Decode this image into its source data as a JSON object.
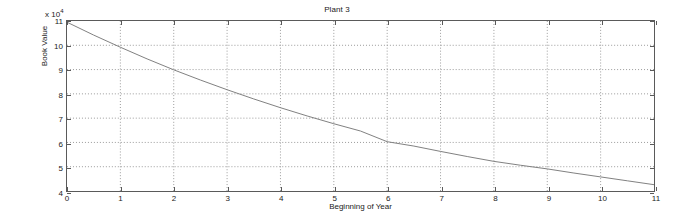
{
  "chart_data": {
    "type": "line",
    "title": "Plant 3",
    "xlabel": "Beginning of Year",
    "ylabel": "Book Value",
    "y_exponent_label": "x 10",
    "y_exponent_power": "4",
    "y_scale_factor": 10000,
    "xlim": [
      0,
      11
    ],
    "ylim": [
      4,
      11
    ],
    "xticks": [
      0,
      1,
      2,
      3,
      4,
      5,
      6,
      7,
      8,
      9,
      10,
      11
    ],
    "yticks": [
      4,
      5,
      6,
      7,
      8,
      9,
      10,
      11
    ],
    "xtick_labels": [
      "0",
      "1",
      "2",
      "3",
      "4",
      "5",
      "6",
      "7",
      "8",
      "9",
      "10",
      "11"
    ],
    "ytick_labels": [
      "4",
      "5",
      "6",
      "7",
      "8",
      "9",
      "10",
      "11"
    ],
    "grid": true,
    "grid_style": "dotted",
    "legend": false,
    "line_color": "#808080",
    "axis_color": "#5a5a5a",
    "background_color": "#ffffff",
    "series": [
      {
        "name": "Book Value",
        "x": [
          0,
          0.5,
          1,
          1.5,
          2,
          2.5,
          3,
          3.5,
          4,
          4.5,
          5,
          5.5,
          6,
          6.5,
          7,
          7.5,
          8,
          8.5,
          9,
          9.5,
          10,
          10.5,
          11
        ],
        "values": [
          10.95,
          10.42,
          9.92,
          9.44,
          8.99,
          8.57,
          8.17,
          7.79,
          7.43,
          7.09,
          6.77,
          6.47,
          6.03,
          5.85,
          5.63,
          5.42,
          5.22,
          5.06,
          4.91,
          4.74,
          4.58,
          4.42,
          4.26
        ]
      }
    ]
  }
}
